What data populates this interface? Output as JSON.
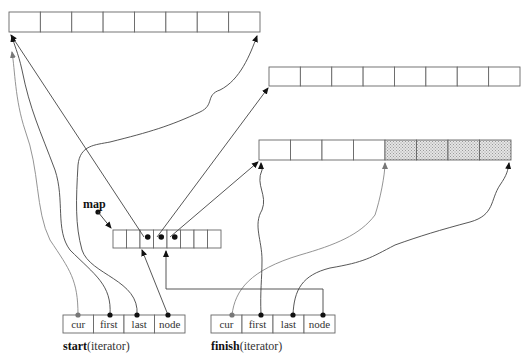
{
  "diagram": {
    "colors": {
      "stroke": "#555555",
      "dot": "#111111",
      "dot_gray": "#777777",
      "shaded_fill": "#d8d8d8",
      "gray_wire": "#888888"
    },
    "buffers": [
      {
        "id": "buffer-1",
        "x": 9,
        "y": 12,
        "width": 251,
        "height": 20,
        "cells": 8,
        "shaded_from": null
      },
      {
        "id": "buffer-2",
        "x": 269,
        "y": 67,
        "width": 251,
        "height": 19,
        "cells": 8,
        "shaded_from": null
      },
      {
        "id": "buffer-3",
        "x": 259,
        "y": 140,
        "width": 252,
        "height": 20,
        "cells": 8,
        "shaded_from": 4
      }
    ],
    "map": {
      "label": "map",
      "x": 113,
      "y": 230,
      "width": 108,
      "height": 18,
      "cells": 8,
      "used_nodes": [
        2,
        3,
        4
      ]
    },
    "iterators": [
      {
        "id": "start",
        "name": "start",
        "suffix": "(iterator)",
        "x": 63,
        "y": 315,
        "width": 122,
        "height": 18,
        "fields": [
          "cur",
          "first",
          "last",
          "node"
        ]
      },
      {
        "id": "finish",
        "name": "finish",
        "suffix": "(iterator)",
        "x": 211,
        "y": 315,
        "width": 124,
        "height": 18,
        "fields": [
          "cur",
          "first",
          "last",
          "node"
        ]
      }
    ]
  }
}
